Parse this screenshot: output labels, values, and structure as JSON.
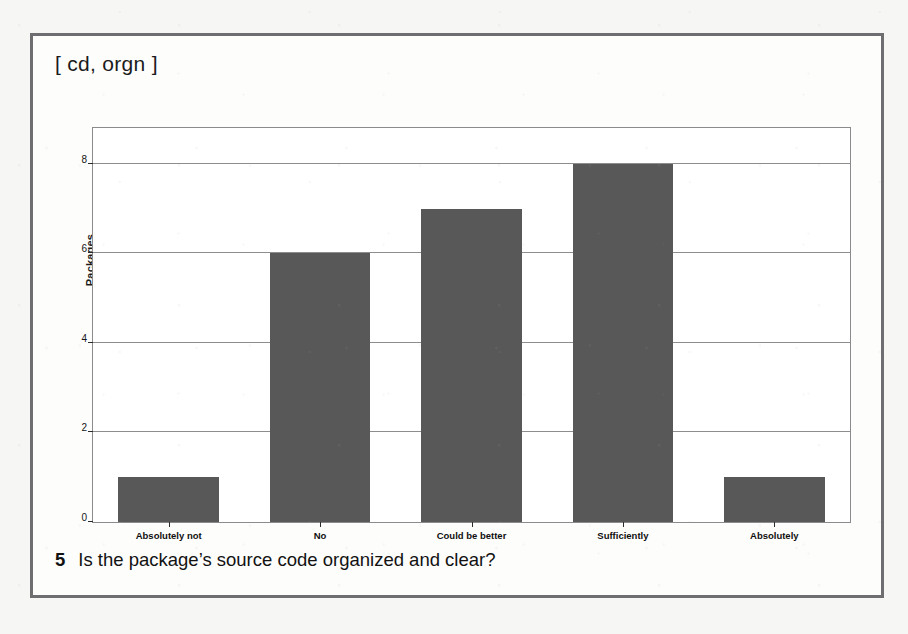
{
  "figure": {
    "tag": "[ cd, orgn ]",
    "caption_number": "5",
    "caption_text": "Is the package’s source code organized and clear?"
  },
  "colors": {
    "bar": "#585858",
    "frame": "#6e6e70",
    "axis": "#8b8b8d",
    "page_background": "#f6f6f4",
    "figure_background": "#fdfdfc"
  },
  "chart_data": {
    "type": "bar",
    "title": "",
    "subtitle": "",
    "xlabel": "",
    "ylabel": "Packages",
    "categories": [
      "Absolutely not",
      "No",
      "Could be better",
      "Sufficiently",
      "Absolutely"
    ],
    "values": [
      1,
      6,
      7,
      8,
      1
    ],
    "ylim": [
      0,
      8.8
    ],
    "yticks": [
      0,
      2,
      4,
      6,
      8
    ],
    "ytick_labels": [
      "0",
      "2",
      "4",
      "6",
      "8"
    ],
    "grid": true,
    "grid_axis": "y",
    "legend": false,
    "legend_position": "none",
    "bar_color": "#585858"
  }
}
